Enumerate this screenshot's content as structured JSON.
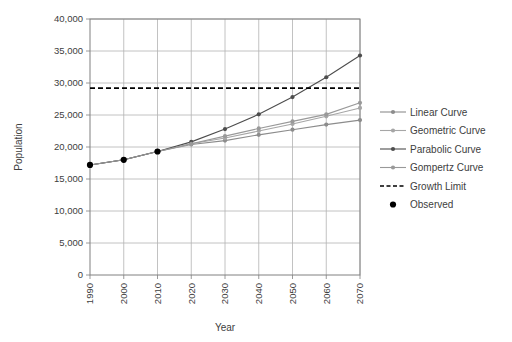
{
  "chart_data": {
    "type": "line",
    "title": "",
    "xlabel": "Year",
    "ylabel": "Population",
    "x": [
      1990,
      2000,
      2010,
      2020,
      2030,
      2040,
      2050,
      2060,
      2070
    ],
    "xlim": [
      1990,
      2070
    ],
    "ylim": [
      0,
      40000
    ],
    "ytick_values": [
      0,
      5000,
      10000,
      15000,
      20000,
      25000,
      30000,
      35000,
      40000
    ],
    "ytick_labels": [
      "0",
      "5,000",
      "10,000",
      "15,000",
      "20,000",
      "25,000",
      "30,000",
      "35,000",
      "40,000"
    ],
    "xtick_labels": [
      "1990",
      "2000",
      "2010",
      "2020",
      "2030",
      "2040",
      "2050",
      "2060",
      "2070"
    ],
    "grid": true,
    "legend_position": "right",
    "growth_limit_value": 29200,
    "series": [
      {
        "name": "Linear Curve",
        "style": "line-marker",
        "color": "#8c8c8c",
        "x": [
          1990,
          2000,
          2010,
          2020,
          2030,
          2040,
          2050,
          2060,
          2070
        ],
        "values": [
          17200,
          18000,
          19300,
          20400,
          21000,
          21900,
          22700,
          23500,
          24200
        ]
      },
      {
        "name": "Geometric Curve",
        "style": "line-marker",
        "color": "#a6a6a6",
        "x": [
          1990,
          2000,
          2010,
          2020,
          2030,
          2040,
          2050,
          2060,
          2070
        ],
        "values": [
          17200,
          18000,
          19300,
          20500,
          21400,
          22500,
          23600,
          24800,
          26100
        ]
      },
      {
        "name": "Parabolic Curve",
        "style": "line-marker",
        "color": "#4d4d4d",
        "x": [
          1990,
          2000,
          2010,
          2020,
          2030,
          2040,
          2050,
          2060,
          2070
        ],
        "values": [
          17200,
          18000,
          19300,
          20800,
          22800,
          25100,
          27800,
          30900,
          34300
        ]
      },
      {
        "name": "Gompertz Curve",
        "style": "line-marker",
        "color": "#999999",
        "x": [
          1990,
          2000,
          2010,
          2020,
          2030,
          2040,
          2050,
          2060,
          2070
        ],
        "values": [
          17200,
          18000,
          19300,
          20500,
          21700,
          22900,
          24000,
          25100,
          26900
        ]
      },
      {
        "name": "Growth Limit",
        "style": "dashed",
        "color": "#000000",
        "x": [
          1990,
          2070
        ],
        "values": [
          29200,
          29200
        ]
      },
      {
        "name": "Observed",
        "style": "marker-only",
        "color": "#000000",
        "x": [
          1990,
          2000,
          2010
        ],
        "values": [
          17200,
          18000,
          19300
        ]
      }
    ]
  },
  "legend": {
    "items": [
      {
        "label": "Linear Curve",
        "color": "#8c8c8c",
        "style": "line-marker"
      },
      {
        "label": "Geometric Curve",
        "color": "#a6a6a6",
        "style": "line-marker"
      },
      {
        "label": "Parabolic Curve",
        "color": "#4d4d4d",
        "style": "line-marker"
      },
      {
        "label": "Gompertz Curve",
        "color": "#999999",
        "style": "line-marker"
      },
      {
        "label": "Growth Limit",
        "color": "#000000",
        "style": "dashed"
      },
      {
        "label": "Observed",
        "color": "#000000",
        "style": "marker-only"
      }
    ]
  }
}
